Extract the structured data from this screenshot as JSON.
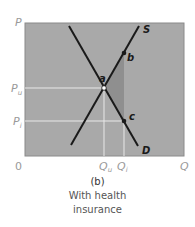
{
  "diagram": {
    "type": "supply-demand",
    "panel_label": "(b)",
    "caption": "With health insurance",
    "caption_line1": "With health",
    "caption_line2": "insurance",
    "axes": {
      "y_label": "P",
      "x_label": "Q",
      "origin": "0"
    },
    "price_ticks": [
      {
        "label": "P",
        "sub": "u"
      },
      {
        "label": "P",
        "sub": "i"
      }
    ],
    "quantity_ticks": [
      {
        "label": "Q",
        "sub": "u"
      },
      {
        "label": "Q",
        "sub": "i"
      }
    ],
    "curves": [
      {
        "name": "S",
        "label": "S"
      },
      {
        "name": "D",
        "label": "D"
      }
    ],
    "points": [
      {
        "name": "a",
        "label": "a"
      },
      {
        "name": "b",
        "label": "b"
      },
      {
        "name": "c",
        "label": "c"
      }
    ],
    "colors": {
      "plot_bg": "#a9a9a9",
      "deadweight_shade": "#8f8f8f",
      "curve": "#1a1a1a",
      "guide": "#e8e8e8"
    }
  }
}
